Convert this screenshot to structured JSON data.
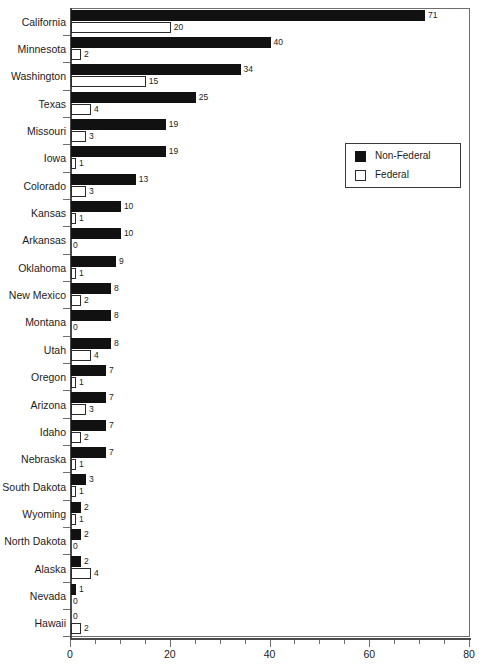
{
  "chart_data": {
    "type": "bar",
    "orientation": "horizontal",
    "title": "",
    "subtitle": "",
    "xlabel": "",
    "ylabel": "",
    "xlim": [
      0,
      80
    ],
    "xticks": [
      0,
      20,
      40,
      60,
      80
    ],
    "xtick_labels": [
      "0",
      "20",
      "40",
      "60",
      "80"
    ],
    "xminor_step": 5,
    "grid": false,
    "legend_position": "upper-right-inside",
    "categories": [
      "California",
      "Minnesota",
      "Washington",
      "Texas",
      "Missouri",
      "Iowa",
      "Colorado",
      "Kansas",
      "Arkansas",
      "Oklahoma",
      "New Mexico",
      "Montana",
      "Utah",
      "Oregon",
      "Arizona",
      "Idaho",
      "Nebraska",
      "South Dakota",
      "Wyoming",
      "North Dakota",
      "Alaska",
      "Nevada",
      "Hawaii"
    ],
    "series": [
      {
        "name": "Non-Federal",
        "color": "#111111",
        "style": "filled",
        "values": [
          71,
          40,
          34,
          25,
          19,
          19,
          13,
          10,
          10,
          9,
          8,
          8,
          8,
          7,
          7,
          7,
          7,
          3,
          2,
          2,
          2,
          1,
          0
        ]
      },
      {
        "name": "Federal",
        "color": "#ffffff",
        "style": "outlined",
        "values": [
          20,
          2,
          15,
          4,
          3,
          1,
          3,
          1,
          0,
          1,
          2,
          0,
          4,
          1,
          3,
          2,
          1,
          1,
          1,
          0,
          4,
          0,
          2
        ]
      }
    ]
  },
  "legend": {
    "entries": [
      {
        "label": "Non-Federal"
      },
      {
        "label": "Federal"
      }
    ]
  },
  "colors": {
    "nonfederal": "#111111",
    "federal": "#ffffff",
    "axis": "#4a4a4a",
    "text": "#1c1c1c",
    "background": "#ffffff"
  }
}
